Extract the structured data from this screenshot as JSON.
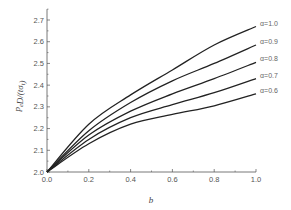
{
  "chart_data": {
    "type": "line",
    "title": "",
    "xlabel": "b",
    "ylabel": "p_e D/(t σ_t)",
    "xlim": [
      0.0,
      1.0
    ],
    "ylim": [
      2.0,
      2.75
    ],
    "xticks": [
      "0.0",
      "0.2",
      "0.4",
      "0.6",
      "0.8",
      "1.0"
    ],
    "yticks": [
      "2.0",
      "2.1",
      "2.2",
      "2.3",
      "2.4",
      "2.5",
      "2.6",
      "2.7"
    ],
    "grid": false,
    "legend_position": "inline-right",
    "x": [
      0.0,
      0.2,
      0.4,
      0.6,
      0.8,
      1.0
    ],
    "series": [
      {
        "name": "α=1.0",
        "values": [
          2.0,
          2.22,
          2.355,
          2.47,
          2.585,
          2.67
        ]
      },
      {
        "name": "α=0.9",
        "values": [
          2.0,
          2.19,
          2.32,
          2.42,
          2.5,
          2.585
        ]
      },
      {
        "name": "α=0.8",
        "values": [
          2.0,
          2.17,
          2.28,
          2.36,
          2.43,
          2.505
        ]
      },
      {
        "name": "α=0.7",
        "values": [
          2.0,
          2.15,
          2.25,
          2.31,
          2.365,
          2.43
        ]
      },
      {
        "name": "α=0.6",
        "values": [
          2.0,
          2.13,
          2.22,
          2.265,
          2.305,
          2.36
        ]
      }
    ],
    "line_color": "#222222",
    "axis_color": "#555555"
  }
}
